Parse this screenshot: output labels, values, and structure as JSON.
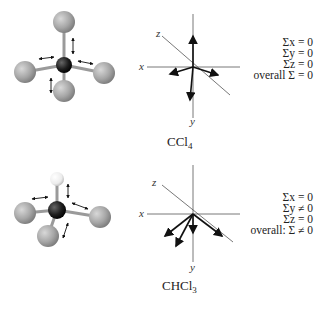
{
  "panels": [
    {
      "molecule": "CCl4",
      "label_main": "CCl",
      "label_sub": "4",
      "axes": {
        "x": "x",
        "y": "y",
        "z": "z"
      },
      "equations": [
        "Σx = 0",
        "Σy = 0",
        "Σz = 0",
        "overall Σ = 0"
      ]
    },
    {
      "molecule": "CHCl3",
      "label_main": "CHCl",
      "label_sub": "3",
      "axes": {
        "x": "x",
        "y": "y",
        "z": "z"
      },
      "equations": [
        "Σx = 0",
        "Σy ≠ 0",
        "Σz = 0",
        "overall: Σ ≠ 0"
      ]
    }
  ],
  "colors": {
    "chlorine": "#a9a9a9",
    "carbon": "#1e1e1e",
    "hydrogen": "#f2f2f2",
    "axis": "#555555",
    "arrow": "#111111"
  }
}
